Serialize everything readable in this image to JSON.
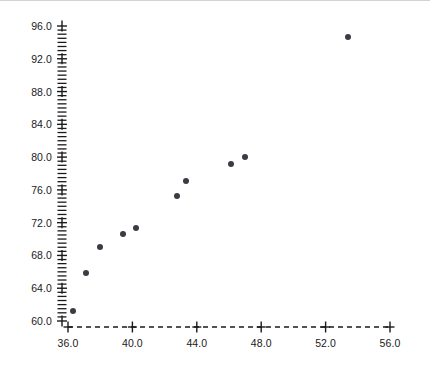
{
  "chart_data": {
    "type": "scatter",
    "title": "",
    "xlabel": "",
    "ylabel": "",
    "xlim": [
      35.0,
      57.0
    ],
    "ylim": [
      58.5,
      97.5
    ],
    "xticks": [
      36.0,
      40.0,
      44.0,
      48.0,
      52.0,
      56.0
    ],
    "xticklabels": [
      "36.0",
      "40.0",
      "44.0",
      "48.0",
      "52.0",
      "56.0"
    ],
    "yticks": [
      60.0,
      64.0,
      68.0,
      72.0,
      76.0,
      80.0,
      84.0,
      88.0,
      92.0,
      96.0
    ],
    "yticklabels": [
      "60.0",
      "64.0",
      "68.0",
      "72.0",
      "76.0",
      "80.0",
      "84.0",
      "88.0",
      "92.0",
      "96.0"
    ],
    "x_minor_tick_step": 1.0,
    "y_minor_tick_step": 0.5,
    "grid": false,
    "legend": null,
    "x_axis_style": "dashed",
    "y_axis_style": "dashed",
    "marker": "filled-circle",
    "marker_color": "#3b3b44",
    "marker_size": 6,
    "points": [
      {
        "x": 36.3,
        "y": 61.2
      },
      {
        "x": 37.1,
        "y": 65.9
      },
      {
        "x": 38.0,
        "y": 69.0
      },
      {
        "x": 39.4,
        "y": 70.6
      },
      {
        "x": 40.2,
        "y": 71.3
      },
      {
        "x": 42.8,
        "y": 75.2
      },
      {
        "x": 43.3,
        "y": 77.1
      },
      {
        "x": 46.1,
        "y": 79.1
      },
      {
        "x": 47.0,
        "y": 80.0
      },
      {
        "x": 53.4,
        "y": 94.7
      }
    ],
    "x": [
      36.3,
      37.1,
      38.0,
      39.4,
      40.2,
      42.8,
      43.3,
      46.1,
      47.0,
      53.4
    ],
    "values": [
      61.2,
      65.9,
      69.0,
      70.6,
      71.3,
      75.2,
      77.1,
      79.1,
      80.0,
      94.7
    ],
    "n_points": 10,
    "colors": {
      "background": "#ffffff",
      "axis": "#1a1a1a",
      "marker": "#3b3b44",
      "text": "#1a1a1a",
      "top_rule": "#d3d3d3"
    }
  },
  "geometry": {
    "x_axis_pixel_start": 68,
    "x_axis_pixel_end": 390,
    "x_axis_pixel_y": 327,
    "y_axis_pixel_x": 62,
    "y_axis_pixel_top": 26,
    "y_axis_pixel_bottom": 321
  }
}
